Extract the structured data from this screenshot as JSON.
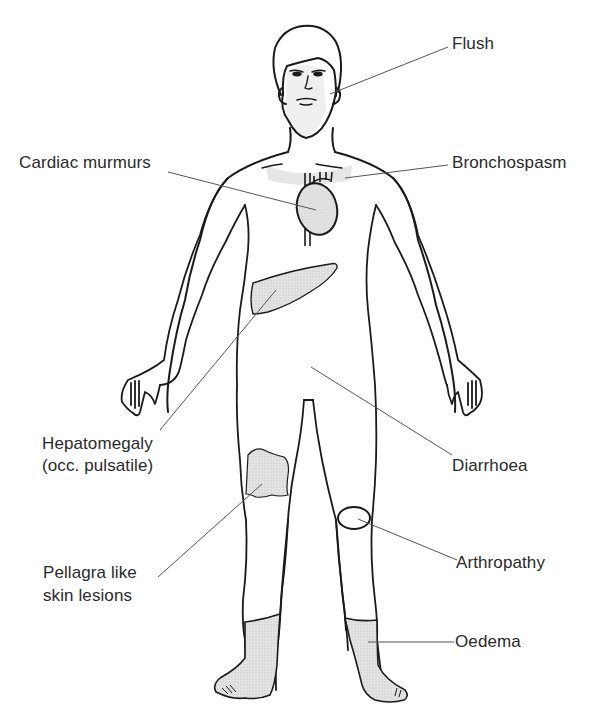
{
  "diagram": {
    "colors": {
      "outline": "#1a1a1a",
      "leader": "#555555",
      "shade": "#dedede",
      "text": "#2a2a2a",
      "background": "#ffffff"
    },
    "labels": [
      {
        "id": "flush",
        "text": "Flush",
        "side": "right",
        "target": "face"
      },
      {
        "id": "bronchospasm",
        "text": "Bronchospasm",
        "side": "right",
        "target": "chest"
      },
      {
        "id": "cardiac",
        "text": "Cardiac murmurs",
        "side": "left",
        "target": "heart"
      },
      {
        "id": "hepatomegaly_1",
        "text": "Hepatomegaly",
        "side": "left",
        "target": "liver"
      },
      {
        "id": "hepatomegaly_2",
        "text": "(occ. pulsatile)",
        "side": "left",
        "target": "liver"
      },
      {
        "id": "diarrhoea",
        "text": "Diarrhoea",
        "side": "right",
        "target": "abdomen"
      },
      {
        "id": "pellagra_1",
        "text": "Pellagra like",
        "side": "left",
        "target": "right-thigh-lesion"
      },
      {
        "id": "pellagra_2",
        "text": "skin lesions",
        "side": "left",
        "target": "right-thigh-lesion"
      },
      {
        "id": "arthropathy",
        "text": "Arthropathy",
        "side": "right",
        "target": "left-knee"
      },
      {
        "id": "oedema",
        "text": "Oedema",
        "side": "right",
        "target": "lower-legs"
      }
    ]
  }
}
